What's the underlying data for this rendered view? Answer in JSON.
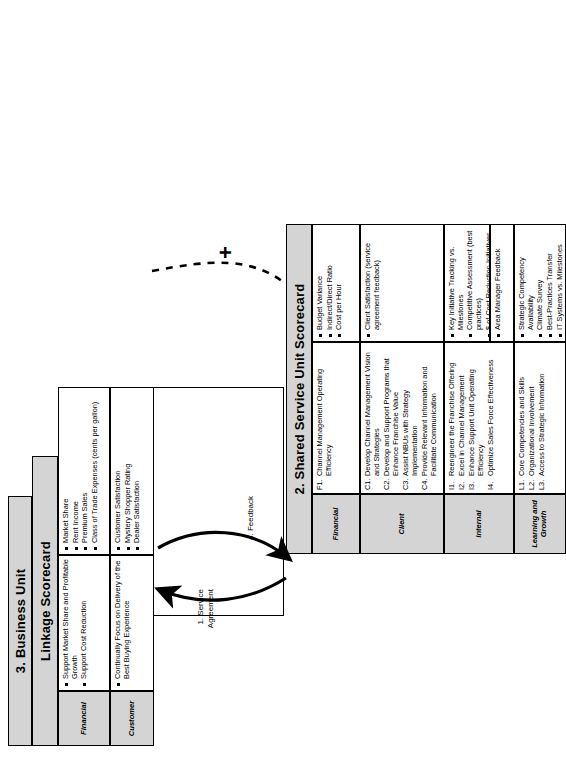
{
  "diagram": {
    "type": "nested-scorecard-linkage",
    "business_unit": {
      "header_label": "3. Business Unit",
      "scorecard_title": "Linkage Scorecard",
      "perspectives": [
        {
          "name": "Financial",
          "objectives": [
            "Support Market Share and Profitable Growth",
            "Support Cost Reduction"
          ],
          "measures": [
            "Market Share",
            "Rent Income",
            "Premium Sales",
            "Class of Trade Expenses (cents per gallon)"
          ]
        },
        {
          "name": "Customer",
          "objectives": [
            "Continually Focus on Delivery of the Best Buying Experience"
          ],
          "measures": [
            "Customer Satisfaction",
            "Mystery Shopper Rating",
            "Dealer Satisfaction"
          ]
        }
      ]
    },
    "shared_service_unit": {
      "scorecard_title": "2. Shared Service Unit Scorecard",
      "perspectives": [
        {
          "name": "Financial",
          "objectives": [
            {
              "num": "F1.",
              "text": "Channel Management Operating Efficiency"
            }
          ],
          "measures": [
            "Budget Variance",
            "Indirect/Direct Ratio",
            "Cost per Hour"
          ]
        },
        {
          "name": "Client",
          "objectives": [
            {
              "num": "C1.",
              "text": "Develop Channel Management Vision and Strategies"
            },
            {
              "num": "C2.",
              "text": "Develop and Support Programs that Enhance Franchise Value"
            },
            {
              "num": "C3.",
              "text": "Assist NBUs with Strategy Implementation"
            },
            {
              "num": "C4.",
              "text": "Provide Relevant Information and Facilitate Communication"
            }
          ],
          "measures": [
            "Client Satisfaction (service agreement feedback)"
          ]
        },
        {
          "name": "Internal",
          "objectives": [
            {
              "num": "I1.",
              "text": "Reengineer the Franchise Offering"
            },
            {
              "num": "I2.",
              "text": "Excel in Channel Management"
            },
            {
              "num": "I3.",
              "text": "Enhance Support Unit Operating Efficiency"
            },
            {
              "num": "I4.",
              "text": "Optimize Sales Force Effectiveness"
            }
          ],
          "measures_group_a": [
            "Key Initiative Tracking vs. Milestones",
            "Competitive Assessment (best practices)",
            "$ of Cost Reduction Initiatives Originated"
          ],
          "measures_group_b": [
            "Area Manager Feedback"
          ]
        },
        {
          "name": "Learning and Growth",
          "objectives": [
            {
              "num": "L1.",
              "text": "Core Competencies and Skills"
            },
            {
              "num": "L2.",
              "text": "Organizational Involvement"
            },
            {
              "num": "L3.",
              "text": "Access to Strategic Information"
            }
          ],
          "measures": [
            "Strategic Competency Availability",
            "Climate Survey",
            "Best-Practices Transfer",
            "IT Systems vs. Milestones"
          ]
        }
      ]
    },
    "flow_labels": {
      "up_arrow": "1. Service Agreement",
      "down_arrow": "4. Feedback",
      "link_marker": "+"
    },
    "colors": {
      "band_fill": "#d4d4d4",
      "line": "#000000",
      "page_background": "#ffffff"
    }
  }
}
